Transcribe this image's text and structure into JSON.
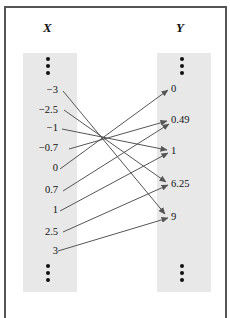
{
  "diagram": {
    "type": "function-mapping",
    "domain_header": "X",
    "codomain_header": "Y",
    "domain_values": [
      "−3",
      "−2.5",
      "−1",
      "−0.7",
      "0",
      "0.7",
      "1",
      "2.5",
      "3"
    ],
    "codomain_values": [
      "0",
      "0.49",
      "1",
      "6.25",
      "9"
    ],
    "mapping": [
      {
        "from": "−3",
        "to": "9"
      },
      {
        "from": "−2.5",
        "to": "6.25"
      },
      {
        "from": "−1",
        "to": "1"
      },
      {
        "from": "−0.7",
        "to": "0.49"
      },
      {
        "from": "0",
        "to": "0"
      },
      {
        "from": "0.7",
        "to": "0.49"
      },
      {
        "from": "1",
        "to": "1"
      },
      {
        "from": "2.5",
        "to": "6.25"
      },
      {
        "from": "3",
        "to": "9"
      }
    ],
    "ellipsis": "⋮",
    "colors": {
      "column_fill": "#e8e8e8",
      "arrow": "#555555",
      "frame": "#555555"
    }
  }
}
